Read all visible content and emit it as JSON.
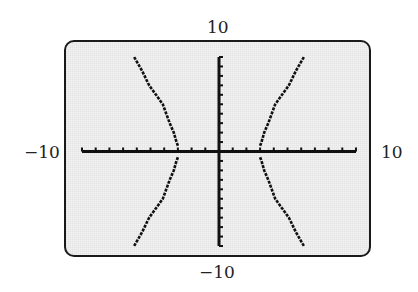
{
  "window": {
    "xmin_label": "−10",
    "xmax_label": "10",
    "ymin_label": "−10",
    "ymax_label": "10"
  },
  "colors": {
    "screen_background": "#ececec",
    "frame": "#1a1a1a",
    "axis": "#111111",
    "curve": "#111111",
    "label_text": "#222222"
  },
  "chart_data": {
    "type": "line",
    "title": "",
    "xlabel": "",
    "ylabel": "",
    "xlim": [
      -10,
      10
    ],
    "ylim": [
      -10,
      10
    ],
    "xscale_tick": 1,
    "yscale_tick": 1,
    "grid": false,
    "tick_labels": {
      "x_left": "−10",
      "x_right": "10",
      "y_top": "10",
      "y_bottom": "−10"
    },
    "series": [
      {
        "name": "upper-left branch",
        "x": [
          -3.0,
          -3.1,
          -3.3,
          -3.6,
          -4.1,
          -4.6,
          -5.1,
          -5.6,
          -6.2
        ],
        "y": [
          0,
          1,
          2,
          3,
          5,
          6,
          7,
          8.5,
          10
        ]
      },
      {
        "name": "lower-left branch",
        "x": [
          -3.0,
          -3.1,
          -3.3,
          -3.6,
          -4.1,
          -4.6,
          -5.1,
          -5.6,
          -6.2
        ],
        "y": [
          0,
          -1,
          -2,
          -3,
          -5,
          -6,
          -7,
          -8.5,
          -10
        ]
      },
      {
        "name": "upper-right branch",
        "x": [
          3.0,
          3.1,
          3.3,
          3.6,
          4.1,
          4.6,
          5.1,
          5.6,
          6.2
        ],
        "y": [
          0,
          1,
          2,
          3,
          5,
          6,
          7,
          8.5,
          10
        ]
      },
      {
        "name": "lower-right branch",
        "x": [
          3.0,
          3.1,
          3.3,
          3.6,
          4.1,
          4.6,
          5.1,
          5.6,
          6.2
        ],
        "y": [
          0,
          -1,
          -2,
          -3,
          -5,
          -6,
          -7,
          -8.5,
          -10
        ]
      }
    ]
  }
}
